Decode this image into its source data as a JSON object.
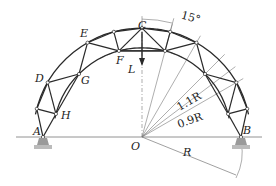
{
  "figure": {
    "type": "arched truss diagram",
    "center": {
      "x": 142,
      "y": 137
    },
    "radius_px": 99,
    "outer_factor": 1.1,
    "inner_factor": 0.9,
    "node_spacing_deg": 15,
    "colors": {
      "line": "#2a2a2a",
      "thin": "#777777",
      "support": "#9a9a9a"
    }
  },
  "labels": {
    "A": "A",
    "B": "B",
    "C": "C",
    "D": "D",
    "E": "E",
    "F": "F",
    "G": "G",
    "H": "H",
    "L": "L",
    "O": "O",
    "angle": "15°",
    "outer_radius": "1.1R",
    "inner_radius": "0.9R",
    "radius": "R"
  }
}
